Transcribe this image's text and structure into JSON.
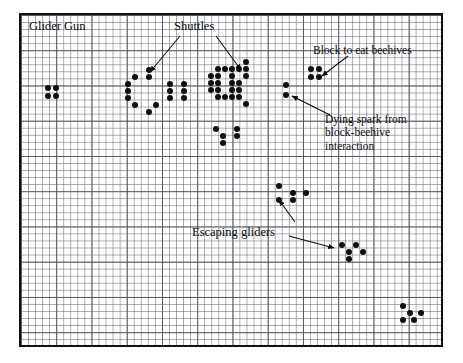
{
  "figure": {
    "title": "Glider Gun",
    "type": "conway-game-of-life-pattern-diagram",
    "background_color": "#ffffff",
    "grid_color": "#5a5a64",
    "cell_color": "#101010",
    "frame_color": "#111111",
    "grid_cell_px": 7,
    "frame": {
      "x": 19,
      "y": 13,
      "width": 424,
      "height": 334
    }
  },
  "labels": {
    "glider_gun": "Glider Gun",
    "shuttles": "Shuttles",
    "block_to_eat_beehives": "Block to eat beehives",
    "dying_spark_line1": "Dying spark from",
    "dying_spark_line2": "block-beehive",
    "dying_spark_line3": "interaction",
    "escaping_gliders": "Escaping gliders"
  },
  "annotations": [
    {
      "name": "shuttles-arrow-left",
      "label": "Shuttles",
      "from": [
        180,
        36
      ],
      "to": [
        150,
        72
      ]
    },
    {
      "name": "shuttles-arrow-right",
      "label": "Shuttles",
      "from": [
        216,
        36
      ],
      "to": [
        241,
        70
      ]
    },
    {
      "name": "block-to-eat-beehives-arrow",
      "label": "Block to eat beehives",
      "from": [
        348,
        56
      ],
      "to": [
        322,
        76
      ]
    },
    {
      "name": "dying-spark-arrow",
      "label": "Dying spark from block-beehive interaction",
      "from": [
        330,
        115
      ],
      "to": [
        292,
        96
      ]
    },
    {
      "name": "escaping-gliders-arrow-up",
      "label": "Escaping gliders",
      "from": [
        295,
        222
      ],
      "to": [
        279,
        200
      ]
    },
    {
      "name": "escaping-gliders-arrow-right",
      "label": "Escaping gliders",
      "from": [
        289,
        236
      ],
      "to": [
        334,
        248
      ]
    }
  ],
  "chart_data": {
    "type": "scatter",
    "title": "Glider Gun",
    "xlabel": "",
    "ylabel": "",
    "grid": true,
    "legend": "none",
    "point_size_px": 6,
    "groups": [
      {
        "name": "left-block",
        "cells": [
          [
            45,
            85
          ],
          [
            53,
            85
          ],
          [
            45,
            93
          ],
          [
            53,
            93
          ]
        ]
      },
      {
        "name": "left-shuttle",
        "cells": [
          [
            146,
            67
          ],
          [
            132,
            74
          ],
          [
            146,
            74
          ],
          [
            125,
            81
          ],
          [
            167,
            81
          ],
          [
            181,
            81
          ],
          [
            125,
            88
          ],
          [
            167,
            88
          ],
          [
            181,
            88
          ],
          [
            125,
            95
          ],
          [
            167,
            95
          ],
          [
            181,
            95
          ],
          [
            132,
            102
          ],
          [
            153,
            102
          ],
          [
            146,
            109
          ]
        ]
      },
      {
        "name": "center-shuttle",
        "cells": [
          [
            243,
            59
          ],
          [
            215,
            66
          ],
          [
            222,
            66
          ],
          [
            229,
            66
          ],
          [
            236,
            66
          ],
          [
            243,
            66
          ],
          [
            208,
            73
          ],
          [
            215,
            73
          ],
          [
            229,
            73
          ],
          [
            243,
            73
          ],
          [
            208,
            80
          ],
          [
            215,
            80
          ],
          [
            229,
            80
          ],
          [
            236,
            80
          ],
          [
            208,
            87
          ],
          [
            215,
            87
          ],
          [
            229,
            87
          ],
          [
            236,
            87
          ],
          [
            215,
            94
          ],
          [
            222,
            94
          ],
          [
            229,
            94
          ],
          [
            236,
            94
          ],
          [
            243,
            101
          ]
        ]
      },
      {
        "name": "center-glider",
        "cells": [
          [
            213,
            126
          ],
          [
            234,
            126
          ],
          [
            220,
            133
          ],
          [
            234,
            133
          ],
          [
            220,
            140
          ]
        ]
      },
      {
        "name": "dying-spark",
        "cells": [
          [
            283,
            82
          ],
          [
            283,
            92
          ]
        ]
      },
      {
        "name": "right-block",
        "cells": [
          [
            308,
            66
          ],
          [
            316,
            66
          ],
          [
            308,
            74
          ],
          [
            316,
            74
          ]
        ]
      },
      {
        "name": "mid-glider",
        "cells": [
          [
            276,
            183
          ],
          [
            290,
            190
          ],
          [
            303,
            190
          ],
          [
            276,
            197
          ],
          [
            290,
            197
          ]
        ]
      },
      {
        "name": "lower-glider",
        "cells": [
          [
            339,
            242
          ],
          [
            353,
            242
          ],
          [
            346,
            249
          ],
          [
            360,
            249
          ],
          [
            346,
            256
          ]
        ]
      },
      {
        "name": "corner-glider",
        "cells": [
          [
            400,
            303
          ],
          [
            407,
            310
          ],
          [
            418,
            310
          ],
          [
            400,
            317
          ],
          [
            411,
            317
          ]
        ]
      }
    ]
  }
}
